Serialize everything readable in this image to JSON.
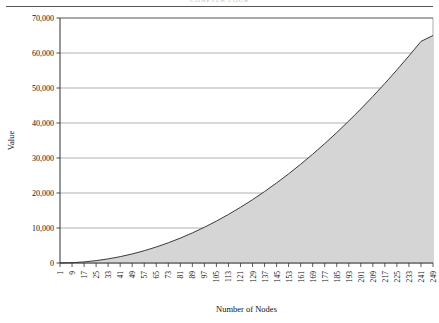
{
  "figure": {
    "running_head": "CHAPTER FOUR",
    "background_color": "#ffffff"
  },
  "chart_data": {
    "type": "area",
    "title": "",
    "xlabel": "Number of Nodes",
    "ylabel": "Value",
    "xlim": [
      1,
      249
    ],
    "ylim": [
      0,
      70000
    ],
    "grid": true,
    "legend": null,
    "fill_color": "#d5d5d5",
    "line_color": "#3a3a3a",
    "ytick_labels": [
      "0",
      "10,000",
      "20,000",
      "30,000",
      "40,000",
      "50,000",
      "60,000",
      "70,000"
    ],
    "ytick_values": [
      0,
      10000,
      20000,
      30000,
      40000,
      50000,
      60000,
      70000
    ],
    "xtick_labels": [
      "1",
      "9",
      "17",
      "25",
      "33",
      "41",
      "49",
      "57",
      "65",
      "73",
      "81",
      "89",
      "97",
      "105",
      "113",
      "121",
      "129",
      "137",
      "145",
      "153",
      "161",
      "169",
      "177",
      "185",
      "193",
      "201",
      "209",
      "217",
      "225",
      "233",
      "241",
      "249"
    ],
    "xtick_values": [
      1,
      9,
      17,
      25,
      33,
      41,
      49,
      57,
      65,
      73,
      81,
      89,
      97,
      105,
      113,
      121,
      129,
      137,
      145,
      153,
      161,
      169,
      177,
      185,
      193,
      201,
      209,
      217,
      225,
      233,
      241,
      249
    ],
    "x": [
      1,
      9,
      17,
      25,
      33,
      41,
      49,
      57,
      65,
      73,
      81,
      89,
      97,
      105,
      113,
      121,
      129,
      137,
      145,
      153,
      161,
      169,
      177,
      185,
      193,
      201,
      209,
      217,
      225,
      233,
      241,
      249
    ],
    "values": [
      0,
      85,
      310,
      670,
      1170,
      1810,
      2590,
      3510,
      4570,
      5770,
      7110,
      8590,
      10210,
      11970,
      13870,
      15910,
      18090,
      20410,
      22870,
      25470,
      28210,
      31090,
      34110,
      37270,
      40570,
      44010,
      47590,
      51310,
      55170,
      59170,
      63310,
      65000
    ],
    "series": [
      {
        "name": "Value",
        "values": [
          0,
          85,
          310,
          670,
          1170,
          1810,
          2590,
          3510,
          4570,
          5770,
          7110,
          8590,
          10210,
          11970,
          13870,
          15910,
          18090,
          20410,
          22870,
          25470,
          28210,
          31090,
          34110,
          37270,
          40570,
          44010,
          47590,
          51310,
          55170,
          59170,
          63310,
          65000
        ]
      }
    ]
  }
}
